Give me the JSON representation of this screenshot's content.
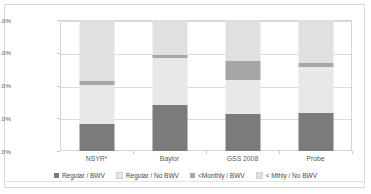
{
  "chart_data": {
    "type": "bar",
    "stacked": true,
    "stack_mode": "percent",
    "title": "",
    "xlabel": "",
    "ylabel": "",
    "ylim": [
      0,
      100
    ],
    "ytick_labels": [
      "0.0%",
      "25.0%",
      "50.0%",
      "75.0%",
      "100.0%"
    ],
    "ytick_values": [
      0,
      25,
      50,
      75,
      100
    ],
    "grid": true,
    "legend_position": "bottom",
    "categories": [
      "NSYR*",
      "Baylor",
      "GSS 2008",
      "Probe"
    ],
    "series": [
      {
        "name": "Regular / BWV",
        "color": "#7b7b7b",
        "values": [
          20.5,
          35.0,
          28.5,
          29.0
        ]
      },
      {
        "name": "Regular / No BWV",
        "color": "#e8e8e8",
        "values": [
          30.0,
          36.0,
          25.5,
          35.0
        ]
      },
      {
        "name": "<Monthly / BWV",
        "color": "#a6a6a6",
        "values": [
          3.0,
          2.0,
          15.0,
          3.5
        ]
      },
      {
        "name": "< Mthly / No BWV",
        "color": "#e0e0e0",
        "values": [
          46.5,
          27.0,
          31.0,
          32.5
        ]
      }
    ]
  },
  "axis": {
    "y": {
      "ticks": [
        {
          "label": "100.0%",
          "value": 100
        },
        {
          "label": "75.0%",
          "value": 75
        },
        {
          "label": "50.0%",
          "value": 50
        },
        {
          "label": "25.0%",
          "value": 25
        },
        {
          "label": "0.0%",
          "value": 0
        }
      ]
    },
    "x": {
      "ticks": [
        {
          "label": "NSYR*"
        },
        {
          "label": "Baylor"
        },
        {
          "label": "GSS 2008"
        },
        {
          "label": "Probe"
        }
      ]
    }
  },
  "legend": {
    "items": [
      {
        "label": "Regular / BWV",
        "color": "#7b7b7b"
      },
      {
        "label": "Regular / No BWV",
        "color": "#e8e8e8"
      },
      {
        "label": "<Monthly / BWV",
        "color": "#a6a6a6"
      },
      {
        "label": "< Mthly / No BWV",
        "color": "#e0e0e0"
      }
    ]
  }
}
